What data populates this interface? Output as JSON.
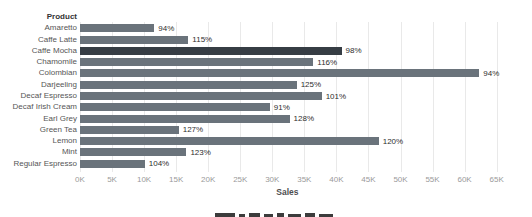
{
  "chart_data": {
    "type": "bar",
    "orientation": "horizontal",
    "category_axis_label": "Product",
    "value_axis_label": "Sales",
    "categories": [
      "Amaretto",
      "Caffe Latte",
      "Caffe Mocha",
      "Chamomile",
      "Colombian",
      "Darjeeling",
      "Decaf Espresso",
      "Decaf Irish Cream",
      "Earl Grey",
      "Green Tea",
      "Lemon",
      "Mint",
      "Regular Espresso"
    ],
    "series": [
      {
        "name": "Sales",
        "values_thousands": [
          11.6,
          16.9,
          40.8,
          36.4,
          62.3,
          33.8,
          37.7,
          29.6,
          32.7,
          15.4,
          46.6,
          16.6,
          10.1
        ]
      }
    ],
    "bar_labels": [
      "94%",
      "115%",
      "98%",
      "116%",
      "94%",
      "125%",
      "101%",
      "91%",
      "128%",
      "127%",
      "120%",
      "123%",
      "104%"
    ],
    "highlighted_category": "Caffe Mocha",
    "xlim_thousands": [
      0,
      66.5
    ],
    "xticks": [
      "0K",
      "5K",
      "10K",
      "15K",
      "20K",
      "25K",
      "30K",
      "35K",
      "40K",
      "45K",
      "50K",
      "55K",
      "60K",
      "65K"
    ],
    "grid": "vertical-light",
    "legend": "none",
    "colors": {
      "bar": "#6a737b",
      "bar_highlight": "#363d44",
      "gridline": "#e9e9e9",
      "tick_label": "#9a9a9a",
      "category_label": "#565656",
      "header_label": "#333333",
      "percent_label": "#2e2e2e",
      "axis_title": "#4f4f4f",
      "background": "#ffffff",
      "caption_fragment": "#3c3c3c"
    },
    "cropped_caption_segments": [
      {
        "x": 215,
        "w": 20,
        "h": 4
      },
      {
        "x": 239,
        "w": 6,
        "h": 3
      },
      {
        "x": 249,
        "w": 11,
        "h": 4
      },
      {
        "x": 264,
        "w": 9,
        "h": 3
      },
      {
        "x": 277,
        "w": 7,
        "h": 4
      },
      {
        "x": 288,
        "w": 13,
        "h": 3
      },
      {
        "x": 305,
        "w": 10,
        "h": 4
      },
      {
        "x": 319,
        "w": 14,
        "h": 3
      }
    ]
  }
}
